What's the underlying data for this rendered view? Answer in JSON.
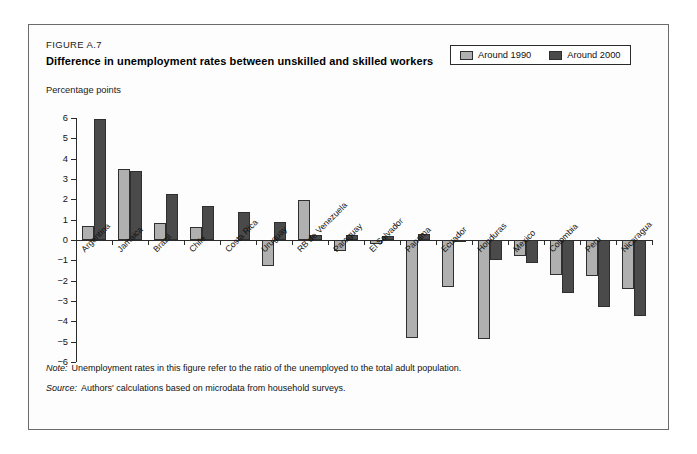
{
  "figure": {
    "number": "FIGURE A.7",
    "title": "Difference in unemployment rates between unskilled and skilled workers",
    "axis_unit": "Percentage points"
  },
  "legend": {
    "position": "top-right",
    "items": [
      {
        "label": "Around 1990",
        "color": "#b0b0b0",
        "swatch": "light"
      },
      {
        "label": "Around 2000",
        "color": "#4a4a4a",
        "swatch": "dark"
      }
    ]
  },
  "notes": [
    {
      "keyword": "Note:",
      "text": "Unemployment rates in this figure refer to the ratio of the unemployed to the total adult population."
    },
    {
      "keyword": "Source:",
      "text": "Authors' calculations based on microdata from household surveys."
    }
  ],
  "chart_data": {
    "type": "bar",
    "title": "Difference in unemployment rates between unskilled and skilled workers",
    "subtitle": "",
    "xlabel": "",
    "ylabel": "Percentage points",
    "ylim": [
      -6,
      6
    ],
    "ytick_step": 1,
    "yticks": [
      6,
      5,
      4,
      3,
      2,
      1,
      0,
      -1,
      -2,
      -3,
      -4,
      -5,
      -6
    ],
    "ytick_labels": [
      "6",
      "5",
      "4",
      "3",
      "2",
      "1",
      "0",
      "−1",
      "−2",
      "−3",
      "−4",
      "−5",
      "−6"
    ],
    "grid": false,
    "categories": [
      "Argentina",
      "Jamaica",
      "Brazil",
      "Chile",
      "Costa Rica",
      "Uruguay",
      "RB de Venezuela",
      "Paraguay",
      "El Salvador",
      "Panama",
      "Ecuador",
      "Honduras",
      "Mexico",
      "Colombia",
      "Peru",
      "Nicaragua"
    ],
    "series": [
      {
        "name": "Around 1990",
        "color": "#b0b0b0",
        "values": [
          0.7,
          3.5,
          0.85,
          0.65,
          0.0,
          -1.3,
          1.95,
          -0.55,
          -0.2,
          -4.8,
          -2.3,
          -4.85,
          -0.8,
          -1.7,
          -1.75,
          -2.4
        ]
      },
      {
        "name": "Around 2000",
        "color": "#4a4a4a",
        "values": [
          5.95,
          3.4,
          2.25,
          1.65,
          1.4,
          0.9,
          0.25,
          0.25,
          0.2,
          0.3,
          -0.1,
          -1.0,
          -1.15,
          -2.6,
          -3.3,
          -3.75
        ]
      }
    ]
  }
}
